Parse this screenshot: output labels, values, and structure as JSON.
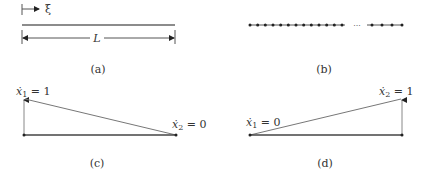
{
  "figure": {
    "panels": {
      "a": {
        "caption": "(a)",
        "coord_symbol": "ξ",
        "length_symbol": "L"
      },
      "b": {
        "caption": "(b)",
        "ellipsis": "···",
        "left_node_count": 13,
        "right_node_count": 4
      },
      "c": {
        "caption": "(c)",
        "left_label": {
          "var": "ẋ",
          "sub": "1",
          "eq": " = 1"
        },
        "right_label": {
          "var": "ẋ",
          "sub": "2",
          "eq": " = 0"
        }
      },
      "d": {
        "caption": "(d)",
        "left_label": {
          "var": "ẋ",
          "sub": "1",
          "eq": " = 0"
        },
        "right_label": {
          "var": "ẋ",
          "sub": "2",
          "eq": " = 1"
        }
      }
    },
    "colors": {
      "line": "#555555",
      "dark": "#222222",
      "light_line": "#888888"
    }
  }
}
